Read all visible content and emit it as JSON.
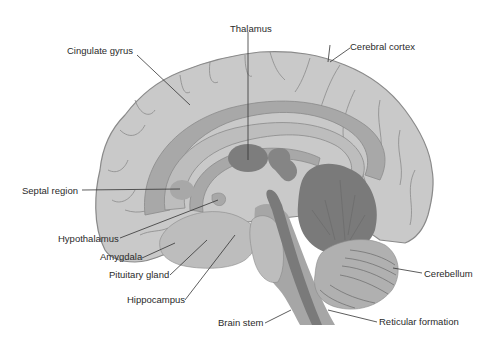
{
  "diagram": {
    "colors": {
      "background": "#ffffff",
      "cortex": "#c9c9c9",
      "cortex_outline": "#8a8a8a",
      "corpus": "#a8a8a8",
      "inner_light": "#bdbdbd",
      "thalamus": "#7d7d7d",
      "dark_structure": "#858585",
      "brainstem": "#a6a6a6",
      "reticular": "#7a7a7a",
      "cerebellum_dark": "#7a7a7a",
      "cerebellum_light": "#b0b0b0",
      "leader_line": "#333333",
      "label_text": "#2a2a2a"
    },
    "labels": {
      "thalamus": "Thalamus",
      "cingulate_gyrus": "Cingulate gyrus",
      "cerebral_cortex": "Cerebral cortex",
      "septal_region": "Septal region",
      "hypothalamus": "Hypothalamus",
      "amygdala": "Amygdala",
      "pituitary_gland": "Pituitary gland",
      "hippocampus": "Hippocampus",
      "cerebellum": "Cerebellum",
      "brain_stem": "Brain stem",
      "reticular_formation": "Reticular formation"
    }
  }
}
